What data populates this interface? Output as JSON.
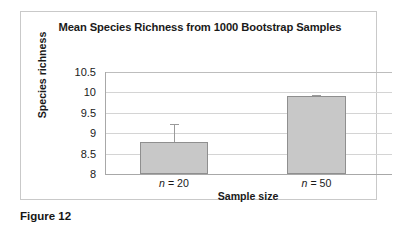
{
  "figure": {
    "caption": "Figure 12"
  },
  "chart_data": {
    "type": "bar",
    "title": "Mean Species Richness from 1000 Bootstrap Samples",
    "xlabel": "Sample size",
    "ylabel": "Species richness",
    "categories": [
      "n = 20",
      "n = 50"
    ],
    "category_parts": [
      {
        "italic": "n",
        "rest": " = 20"
      },
      {
        "italic": "n",
        "rest": " = 50"
      }
    ],
    "values": [
      8.79,
      9.91
    ],
    "errors_upper": [
      0.44,
      0.03
    ],
    "ylim": [
      8,
      10.5
    ],
    "yticks": [
      "10.5",
      "10",
      "9.5",
      "9",
      "8.5",
      "8"
    ],
    "ytick_values": [
      10.5,
      10,
      9.5,
      9,
      8.5,
      8
    ],
    "grid": true,
    "legend": "none",
    "colors": {
      "bar_fill": "#c8c8c8",
      "bar_border": "#8f8f8f",
      "gridline": "#d4d4d4",
      "axis": "#a8a8a8",
      "text": "#1a1a1a",
      "frame": "#c9c9c9"
    }
  }
}
